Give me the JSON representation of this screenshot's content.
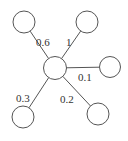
{
  "diagram": {
    "type": "star-graph",
    "center": {
      "id": "c",
      "cx": 55,
      "cy": 68,
      "r": 11.5
    },
    "nodes": [
      {
        "id": "top-left",
        "cx": 24,
        "cy": 22,
        "r": 11
      },
      {
        "id": "top-right",
        "cx": 87,
        "cy": 22,
        "r": 11
      },
      {
        "id": "right",
        "cx": 110,
        "cy": 67,
        "r": 10.5
      },
      {
        "id": "bottom-left",
        "cx": 23,
        "cy": 117,
        "r": 11
      },
      {
        "id": "bottom-right",
        "cx": 98,
        "cy": 114,
        "r": 11
      }
    ],
    "edges": [
      {
        "to": "top-left",
        "weight": "0.6",
        "label_x": 36,
        "label_y": 46
      },
      {
        "to": "top-right",
        "weight": "1",
        "label_x": 66,
        "label_y": 46
      },
      {
        "to": "right",
        "weight": "0.1",
        "label_x": 78,
        "label_y": 81
      },
      {
        "to": "bottom-left",
        "weight": "0.3",
        "label_x": 16,
        "label_y": 102
      },
      {
        "to": "bottom-right",
        "weight": "0.2",
        "label_x": 60,
        "label_y": 103
      }
    ]
  }
}
